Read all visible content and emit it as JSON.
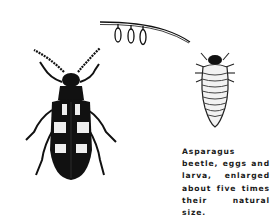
{
  "figure": {
    "caption": "Asparagus beetle, eggs and larva, enlarged about five times their natural size.",
    "subjects": [
      "asparagus-beetle",
      "eggs",
      "larva"
    ],
    "colors": {
      "ink": "#111111",
      "paper": "#ffffff"
    }
  }
}
